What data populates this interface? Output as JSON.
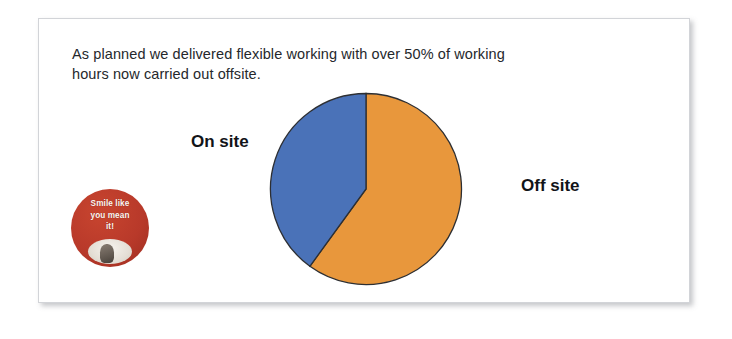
{
  "slide": {
    "heading": "As planned we delivered flexible working with over 50% of working\nhours now carried out offsite."
  },
  "badge": {
    "text": "Smile like\nyou mean\nit!",
    "color": "#b8392a",
    "photo_name": "badge-photo"
  },
  "chart_data": {
    "type": "pie",
    "title": "",
    "subtitle": "",
    "xlabel": "",
    "ylabel": "",
    "legend_position": "none",
    "grid": false,
    "labels_inline": true,
    "start_angle_deg": 0,
    "direction": "clockwise",
    "categories": [
      "Off site",
      "On site"
    ],
    "values": [
      60,
      40
    ],
    "slices": [
      {
        "label": "Off site",
        "value": 60,
        "color": "#e8973c",
        "start_angle_deg": 0,
        "end_angle_deg": 216,
        "label_position": "right"
      },
      {
        "label": "On site",
        "value": 40,
        "color": "#4a72b8",
        "start_angle_deg": 216,
        "end_angle_deg": 360,
        "label_position": "left"
      }
    ],
    "outline_color": "#2d2f33"
  },
  "labels": {
    "on_site": "On site",
    "off_site": "Off site"
  }
}
